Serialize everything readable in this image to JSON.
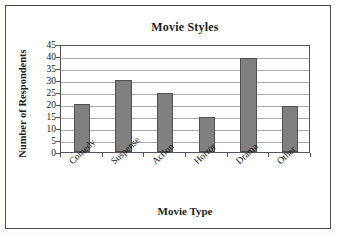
{
  "chart_data": {
    "type": "bar",
    "title": "Movie Styles",
    "xlabel": "Movie Type",
    "ylabel": "Number of Respondents",
    "categories": [
      "Comedy",
      "Suspense",
      "Action",
      "Horror",
      "Drama",
      "Other"
    ],
    "values": [
      20,
      30,
      24.5,
      14.5,
      39,
      19
    ],
    "ylim": [
      0,
      45
    ],
    "yticks": [
      0,
      5,
      10,
      15,
      20,
      25,
      30,
      35,
      40,
      45
    ],
    "ytick_labels": [
      "0",
      "5",
      "10",
      "15",
      "20",
      "25",
      "30",
      "35",
      "40",
      "45"
    ],
    "grid": true,
    "legend": "none",
    "bar_color": "#808080",
    "bar_edge_color": "#4f4f4f",
    "gridline_color": "#a9a9ad",
    "axis_color": "#53535b",
    "frame_color": "#4a4a52",
    "background": "#ffffff"
  }
}
